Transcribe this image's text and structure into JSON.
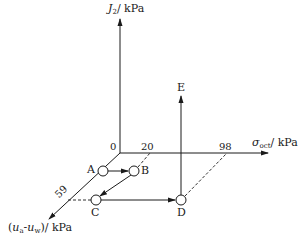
{
  "diagram": {
    "axes": {
      "vertical": {
        "symbol": "J",
        "subscript": "2",
        "unit": "/ kPa"
      },
      "horizontal": {
        "symbol": "σ",
        "subscript": "oct",
        "unit": "/ kPa"
      },
      "diagonal": {
        "symbol_open": "(",
        "var1": "u",
        "sub1": "a",
        "dash": "-",
        "var2": "u",
        "sub2": "w",
        "symbol_close": ")",
        "unit": "/ kPa"
      }
    },
    "ticks": {
      "origin": "0",
      "horizontal_a": "20",
      "horizontal_b": "98",
      "diagonal_a": "59"
    },
    "points": [
      {
        "id": "A",
        "label": "A"
      },
      {
        "id": "B",
        "label": "B"
      },
      {
        "id": "C",
        "label": "C"
      },
      {
        "id": "D",
        "label": "D"
      },
      {
        "id": "E",
        "label": "E"
      }
    ],
    "paths": [
      {
        "from": "A",
        "to": "B"
      },
      {
        "from": "B",
        "to": "C"
      },
      {
        "from": "C",
        "to": "D"
      },
      {
        "from": "D",
        "to": "E"
      }
    ],
    "colors": {
      "line": "#1a1a1a",
      "background": "#ffffff"
    }
  }
}
